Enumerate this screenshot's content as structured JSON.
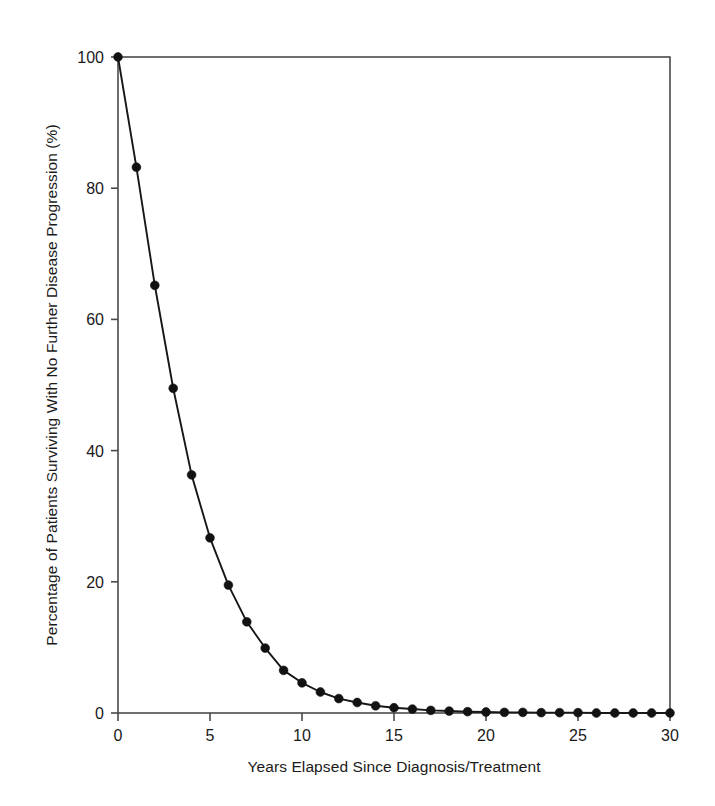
{
  "chart_data": {
    "type": "line",
    "title": "",
    "subtitle": "",
    "xlabel": "Years Elapsed Since Diagnosis/Treatment",
    "ylabel": "Percentage of Patients Surviving With No Further Disease Progression (%)",
    "xlim": [
      0,
      30
    ],
    "ylim": [
      0,
      100
    ],
    "xticks": [
      0,
      5,
      10,
      15,
      20,
      25,
      30
    ],
    "xtick_labels": [
      "0",
      "5",
      "10",
      "15",
      "20",
      "25",
      "30"
    ],
    "yticks": [
      0,
      20,
      40,
      60,
      80,
      100
    ],
    "ytick_labels": [
      "0",
      "20",
      "40",
      "60",
      "80",
      "100"
    ],
    "grid": false,
    "legend": false,
    "legend_position": "none",
    "frame": "box",
    "marker": "filled-circle",
    "line_color": "#171717",
    "marker_color": "#121212",
    "axis_color": "#4a4a4a",
    "background_color": "#ffffff",
    "x": [
      0,
      1,
      2,
      3,
      4,
      5,
      6,
      7,
      8,
      9,
      10,
      11,
      12,
      13,
      14,
      15,
      16,
      17,
      18,
      19,
      20,
      21,
      22,
      23,
      24,
      25,
      26,
      27,
      28,
      29,
      30
    ],
    "series": [
      {
        "name": "Progression-free survival",
        "values": [
          100,
          83.2,
          65.2,
          49.5,
          36.3,
          26.7,
          19.5,
          13.9,
          9.9,
          6.5,
          4.6,
          3.2,
          2.2,
          1.6,
          1.1,
          0.8,
          0.6,
          0.4,
          0.3,
          0.2,
          0.15,
          0.1,
          0.1,
          0.05,
          0.05,
          0.05,
          0,
          0,
          0,
          0,
          0
        ]
      }
    ],
    "annotations": []
  }
}
